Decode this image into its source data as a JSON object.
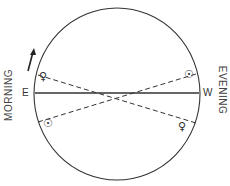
{
  "diagram": {
    "labels": {
      "left_side": "MORNING",
      "right_side": "EVENING",
      "east": "E",
      "west": "W"
    },
    "symbols": {
      "venus_upper_left": "♀",
      "sun_upper_right": "☉",
      "sun_lower_left": "☉",
      "venus_lower_right": "♀"
    },
    "icons": {
      "direction_arrow": "arrow-up-icon"
    },
    "colors": {
      "line": "#333333",
      "background": "#ffffff"
    }
  }
}
